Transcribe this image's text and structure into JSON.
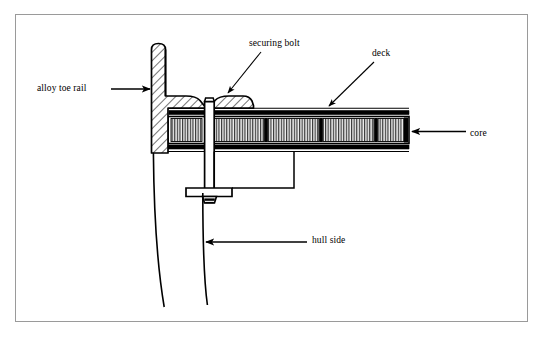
{
  "figure": {
    "kind": "technical-cross-section",
    "background_color": "#ffffff",
    "frame_color": "#9a9a9a",
    "ink_color": "#000000"
  },
  "labels": {
    "alloy_toe_rail": "alloy toe rail",
    "securing_bolt": "securing bolt",
    "deck": "deck",
    "core": "core",
    "hull_side": "hull side"
  },
  "icons": {
    "leader_arrow_toe_rail": "arrow-right-icon",
    "leader_arrow_securing_bolt": "arrow-down-left-icon",
    "leader_arrow_deck": "arrow-down-left-icon",
    "leader_arrow_core": "arrow-left-icon",
    "leader_arrow_hull_side": "arrow-left-icon"
  },
  "parts": {
    "toe_rail": {
      "name": "alloy toe rail",
      "hatch": "diagonal-45",
      "description": "vertical extrusion with rounded top and horizontal inboard flange"
    },
    "securing_bolt": {
      "name": "securing bolt",
      "description": "countersunk head seated in rail notch, shaft through deck, nut and backing plate below"
    },
    "deck": {
      "name": "deck",
      "description": "sandwich panel with upper and lower skins"
    },
    "core": {
      "name": "core",
      "hatch": "vertical-stripe",
      "blocks": 5,
      "description": "end-grain core blocks between deck skins separated by dark glue lines"
    },
    "hull_side": {
      "name": "hull side",
      "description": "two slightly curved laminate lines running down from the joint"
    }
  }
}
